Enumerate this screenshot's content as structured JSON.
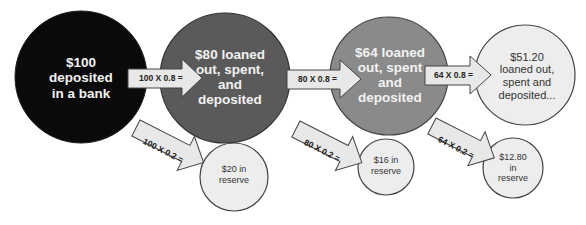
{
  "diagram": {
    "colors": {
      "deposit_circle": "#0a0a0a",
      "loan1_circle": "#5a5a5a",
      "loan2_circle": "#8a8a8a",
      "loan3_circle": "#ededed",
      "reserve_circle": "#ededed",
      "arrow_fill": "#e8e8e8",
      "outline": "#444444"
    },
    "nodes": [
      {
        "id": "deposit",
        "label": "$100 deposited in a bank",
        "lines": [
          "$100",
          "deposited",
          "in a bank"
        ]
      },
      {
        "id": "loan1",
        "label": "$80 loaned out, spent, and deposited",
        "lines": [
          "$80 loaned",
          "out, spent,",
          "and",
          "deposited"
        ]
      },
      {
        "id": "loan2",
        "label": "$64 loaned out, spent and deposited",
        "lines": [
          "$64 loaned",
          "out, spent",
          "and",
          "deposited"
        ]
      },
      {
        "id": "loan3",
        "label": "$51.20 loaned out, spent and deposited...",
        "lines": [
          "$51.20",
          "loaned out,",
          "spent and",
          "deposited..."
        ]
      }
    ],
    "reserves": [
      {
        "id": "reserve1",
        "lines": [
          "$20 in",
          "reserve"
        ]
      },
      {
        "id": "reserve2",
        "lines": [
          "$16 in",
          "reserve"
        ]
      },
      {
        "id": "reserve3",
        "lines": [
          "$12.80",
          "in",
          "reserve"
        ]
      }
    ],
    "arrows": {
      "loan": [
        "100 X 0.8 =",
        "80 X 0.8 =",
        "64 X 0.8 ="
      ],
      "reserve": [
        "100 X 0.2 =",
        "80 X 0.2 =",
        "64 X 0.2 ="
      ]
    }
  }
}
